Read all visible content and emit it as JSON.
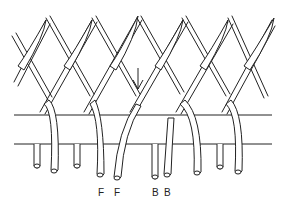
{
  "diagram": {
    "arrow": {
      "direction": "down",
      "x": 138,
      "y_top": 68,
      "y_bottom": 89
    },
    "labels": [
      {
        "text": "F",
        "x": 98,
        "y": 188
      },
      {
        "text": "F",
        "x": 114,
        "y": 188
      },
      {
        "text": "B",
        "x": 152,
        "y": 188
      },
      {
        "text": "B",
        "x": 164,
        "y": 188
      }
    ],
    "colors": {
      "line": "#222222",
      "background": "#ffffff",
      "fill": "#ffffff"
    }
  }
}
